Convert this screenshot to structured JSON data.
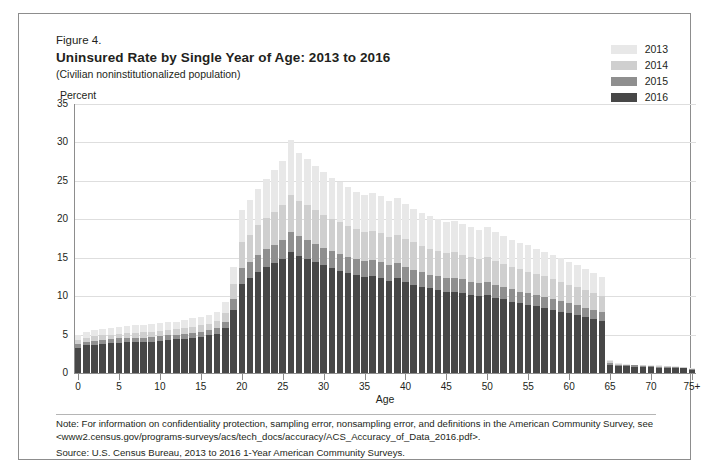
{
  "figure": {
    "label": "Figure 4.",
    "title": "Uninsured Rate by Single Year of Age: 2013 to 2016",
    "subtitle": "(Civilian noninstitutionalized population)",
    "note": "Note: For information on confidentiality protection, sampling error, nonsampling error, and definitions in the American Community Survey, see <www2.census.gov/programs-surveys/acs/tech_docs/accuracy/ACS_Accuracy_of_Data_2016.pdf>.",
    "source": "Source: U.S. Census Bureau, 2013 to 2016 1-Year American Community Surveys."
  },
  "colors": {
    "y2013": "#e8e8e8",
    "y2014": "#cfcfcf",
    "y2015": "#8f8f8f",
    "y2016": "#474747",
    "gridline": "#dedede",
    "axis": "#8d8d8d",
    "frame": "#8d8d8d",
    "text": "#231f20"
  },
  "chart_data": {
    "type": "bar",
    "title": "Uninsured Rate by Single Year of Age: 2013 to 2016",
    "subtitle": "(Civilian noninstitutionalized population)",
    "xlabel": "Age",
    "ylabel": "Percent",
    "ylim": [
      0,
      35
    ],
    "yticks": [
      0,
      5,
      10,
      15,
      20,
      25,
      30,
      35
    ],
    "xticks": [
      0,
      5,
      10,
      15,
      20,
      25,
      30,
      35,
      40,
      45,
      50,
      55,
      60,
      65,
      70,
      75
    ],
    "xtick_labels": [
      "0",
      "5",
      "10",
      "15",
      "20",
      "25",
      "30",
      "35",
      "40",
      "45",
      "50",
      "55",
      "60",
      "65",
      "70",
      "75+"
    ],
    "grid": true,
    "legend_position": "top-right",
    "overlay_style": "overlaid",
    "categories": [
      "0",
      "1",
      "2",
      "3",
      "4",
      "5",
      "6",
      "7",
      "8",
      "9",
      "10",
      "11",
      "12",
      "13",
      "14",
      "15",
      "16",
      "17",
      "18",
      "19",
      "20",
      "21",
      "22",
      "23",
      "24",
      "25",
      "26",
      "27",
      "28",
      "29",
      "30",
      "31",
      "32",
      "33",
      "34",
      "35",
      "36",
      "37",
      "38",
      "39",
      "40",
      "41",
      "42",
      "43",
      "44",
      "45",
      "46",
      "47",
      "48",
      "49",
      "50",
      "51",
      "52",
      "53",
      "54",
      "55",
      "56",
      "57",
      "58",
      "59",
      "60",
      "61",
      "62",
      "63",
      "64",
      "65",
      "66",
      "67",
      "68",
      "69",
      "70",
      "71",
      "72",
      "73",
      "74",
      "75+"
    ],
    "series": [
      {
        "name": "2013",
        "color": "#e8e8e8",
        "values": [
          5.0,
          5.4,
          5.6,
          5.7,
          5.9,
          6.0,
          6.1,
          6.2,
          6.3,
          6.4,
          6.5,
          6.6,
          6.7,
          6.9,
          7.1,
          7.3,
          7.6,
          8.0,
          9.2,
          13.8,
          21.2,
          22.5,
          24.0,
          25.3,
          26.4,
          27.6,
          30.3,
          28.6,
          27.8,
          27.0,
          26.2,
          25.4,
          24.8,
          24.2,
          23.6,
          23.2,
          23.4,
          23.0,
          22.4,
          22.8,
          22.0,
          21.4,
          20.8,
          20.4,
          20.0,
          19.6,
          19.8,
          19.4,
          19.0,
          18.6,
          19.0,
          18.4,
          17.8,
          17.3,
          16.9,
          16.6,
          16.2,
          15.8,
          15.3,
          14.9,
          14.4,
          14.0,
          13.5,
          13.0,
          12.5,
          1.7,
          1.3,
          1.2,
          1.1,
          1.0,
          1.0,
          1.0,
          0.9,
          0.9,
          0.8,
          0.6
        ]
      },
      {
        "name": "2014",
        "color": "#cfcfcf",
        "values": [
          4.3,
          4.6,
          4.8,
          4.9,
          5.0,
          5.1,
          5.2,
          5.2,
          5.3,
          5.4,
          5.5,
          5.6,
          5.7,
          5.8,
          6.0,
          6.2,
          6.4,
          6.8,
          7.8,
          11.6,
          17.0,
          18.0,
          19.2,
          20.2,
          21.0,
          21.8,
          23.2,
          22.4,
          21.8,
          21.2,
          20.6,
          20.0,
          19.6,
          19.1,
          18.7,
          18.4,
          18.5,
          18.2,
          17.7,
          18.0,
          17.4,
          17.0,
          16.5,
          16.2,
          15.9,
          15.6,
          15.7,
          15.4,
          15.1,
          14.8,
          15.1,
          14.6,
          14.2,
          13.8,
          13.5,
          13.2,
          12.9,
          12.6,
          12.2,
          11.9,
          11.5,
          11.2,
          10.8,
          10.4,
          10.0,
          1.5,
          1.2,
          1.1,
          1.0,
          1.0,
          0.9,
          0.9,
          0.9,
          0.8,
          0.8,
          0.5
        ]
      },
      {
        "name": "2015",
        "color": "#8f8f8f",
        "values": [
          3.8,
          4.1,
          4.2,
          4.3,
          4.4,
          4.5,
          4.5,
          4.6,
          4.6,
          4.7,
          4.8,
          4.9,
          5.0,
          5.1,
          5.2,
          5.4,
          5.6,
          5.9,
          6.7,
          9.6,
          13.6,
          14.4,
          15.3,
          16.1,
          16.7,
          17.3,
          18.4,
          17.8,
          17.3,
          16.8,
          16.3,
          15.9,
          15.5,
          15.1,
          14.8,
          14.6,
          14.7,
          14.4,
          14.0,
          14.3,
          13.8,
          13.4,
          13.1,
          12.8,
          12.6,
          12.3,
          12.4,
          12.2,
          11.9,
          11.7,
          11.9,
          11.5,
          11.2,
          10.9,
          10.6,
          10.4,
          10.1,
          9.9,
          9.6,
          9.4,
          9.1,
          8.8,
          8.5,
          8.2,
          7.9,
          1.3,
          1.1,
          1.0,
          1.0,
          0.9,
          0.9,
          0.8,
          0.8,
          0.8,
          0.7,
          0.5
        ]
      },
      {
        "name": "2016",
        "color": "#474747",
        "values": [
          3.3,
          3.6,
          3.7,
          3.8,
          3.9,
          3.9,
          4.0,
          4.0,
          4.1,
          4.1,
          4.2,
          4.3,
          4.4,
          4.4,
          4.5,
          4.7,
          4.9,
          5.1,
          5.8,
          8.2,
          11.6,
          12.3,
          13.1,
          13.8,
          14.3,
          14.8,
          15.7,
          15.2,
          14.8,
          14.4,
          14.0,
          13.6,
          13.3,
          13.0,
          12.7,
          12.5,
          12.6,
          12.4,
          12.0,
          12.3,
          11.8,
          11.5,
          11.2,
          11.0,
          10.8,
          10.5,
          10.6,
          10.4,
          10.2,
          10.0,
          10.2,
          9.8,
          9.6,
          9.3,
          9.1,
          8.9,
          8.7,
          8.5,
          8.2,
          8.0,
          7.8,
          7.5,
          7.3,
          7.0,
          6.8,
          1.1,
          0.9,
          0.9,
          0.8,
          0.8,
          0.8,
          0.7,
          0.7,
          0.7,
          0.6,
          0.4
        ]
      }
    ]
  },
  "legend": {
    "items": [
      {
        "label": "2013",
        "color": "#e8e8e8"
      },
      {
        "label": "2014",
        "color": "#cfcfcf"
      },
      {
        "label": "2015",
        "color": "#8f8f8f"
      },
      {
        "label": "2016",
        "color": "#474747"
      }
    ]
  }
}
